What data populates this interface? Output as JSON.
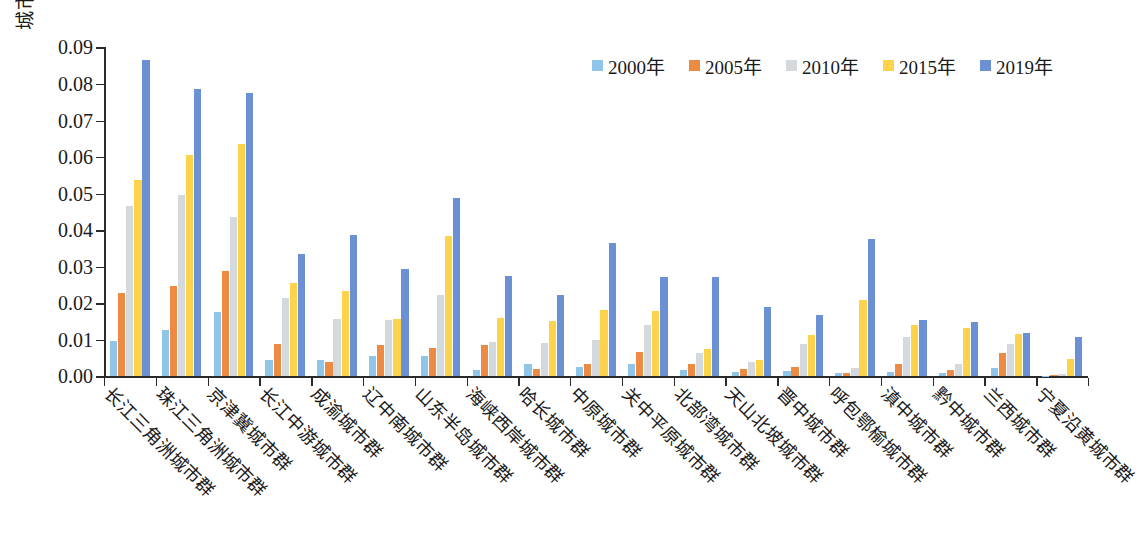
{
  "chart_data": {
    "type": "bar",
    "title": "",
    "xlabel": "",
    "ylabel": "城市群功能多中心性",
    "ylim": [
      0.0,
      0.09
    ],
    "ytick_labels": [
      "0.00",
      "0.01",
      "0.02",
      "0.03",
      "0.04",
      "0.05",
      "0.06",
      "0.07",
      "0.08",
      "0.09"
    ],
    "ytick_values": [
      0.0,
      0.01,
      0.02,
      0.03,
      0.04,
      0.05,
      0.06,
      0.07,
      0.08,
      0.09
    ],
    "grid": false,
    "legend_position": "top-right",
    "categories": [
      "长江三角洲城市群",
      "珠江三角洲城市群",
      "京津冀城市群",
      "长江中游城市群",
      "成渝城市群",
      "辽中南城市群",
      "山东半岛城市群",
      "海峡西岸城市群",
      "哈长城市群",
      "中原城市群",
      "关中平原城市群",
      "北部湾城市群",
      "天山北坡城市群",
      "晋中城市群",
      "呼包鄂榆城市群",
      "滇中城市群",
      "黔中城市群",
      "兰西城市群",
      "宁夏沿黄城市群"
    ],
    "series": [
      {
        "name": "2000年",
        "color": "#8ec5e8",
        "values": [
          0.0098,
          0.0127,
          0.0175,
          0.0046,
          0.0045,
          0.0057,
          0.0057,
          0.0017,
          0.0035,
          0.0027,
          0.0033,
          0.0018,
          0.0011,
          0.0015,
          0.0009,
          0.0012,
          0.001,
          0.0024,
          0.0002
        ]
      },
      {
        "name": "2005年",
        "color": "#ed8b45",
        "values": [
          0.0227,
          0.0248,
          0.0288,
          0.0088,
          0.004,
          0.0086,
          0.0077,
          0.0085,
          0.0019,
          0.0035,
          0.0067,
          0.0035,
          0.002,
          0.0026,
          0.0008,
          0.0035,
          0.0018,
          0.0065,
          0.0004
        ]
      },
      {
        "name": "2010年",
        "color": "#d4d9dd",
        "values": [
          0.0465,
          0.0496,
          0.0437,
          0.0215,
          0.0157,
          0.0155,
          0.0224,
          0.0095,
          0.0092,
          0.01,
          0.014,
          0.0064,
          0.004,
          0.0088,
          0.0022,
          0.0108,
          0.0033,
          0.009,
          0.0006
        ]
      },
      {
        "name": "2015年",
        "color": "#fcd34b",
        "values": [
          0.0537,
          0.0607,
          0.0637,
          0.0255,
          0.0235,
          0.0157,
          0.0385,
          0.016,
          0.0151,
          0.0181,
          0.0178,
          0.0076,
          0.0046,
          0.0112,
          0.0208,
          0.014,
          0.0133,
          0.0116,
          0.0049
        ]
      },
      {
        "name": "2019年",
        "color": "#6b90d4",
        "values": [
          0.0866,
          0.0787,
          0.0776,
          0.0336,
          0.0386,
          0.0295,
          0.0487,
          0.0274,
          0.0224,
          0.0364,
          0.0273,
          0.0273,
          0.0189,
          0.0167,
          0.0377,
          0.0154,
          0.0148,
          0.0118,
          0.0108
        ]
      }
    ]
  }
}
